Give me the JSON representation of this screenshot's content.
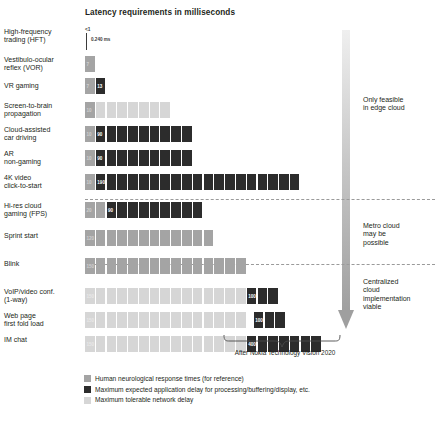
{
  "title": "Latency requirements in milliseconds",
  "caption": "After Nokia Technology Vision 2020",
  "colors": {
    "human": "#a4a4a4",
    "app": "#2c2c2c",
    "net": "#d6d6d6",
    "text": "#231f20"
  },
  "hft_axis": {
    "lt1_label": "<1",
    "value_label": "0.240 ms"
  },
  "zones": [
    {
      "id": "edge",
      "text": "Only feasible\nin edge cloud"
    },
    {
      "id": "metro",
      "text": "Metro cloud\nmay be\npossible"
    },
    {
      "id": "centralized",
      "text": "Centralized\ncloud\nimplementation\nviable"
    }
  ],
  "legend": [
    {
      "key": "human",
      "label": "Human neurological response times (for reference)"
    },
    {
      "key": "app",
      "label": "Maximum expected application delay for processing/buffering/display, etc."
    },
    {
      "key": "net",
      "label": "Maximum tolerable network delay"
    }
  ],
  "chart_data": {
    "type": "bar",
    "orientation": "horizontal",
    "title": "Latency requirements in milliseconds",
    "xlabel": "",
    "ylabel": "",
    "unit": "ms",
    "block_size_ms": 10,
    "grid": false,
    "legend_position": "bottom",
    "series": [
      {
        "name": "Human neurological response times (for reference)",
        "key": "human"
      },
      {
        "name": "Maximum expected application delay for processing/buffering/display, etc.",
        "key": "app"
      },
      {
        "name": "Maximum tolerable network delay",
        "key": "net"
      }
    ],
    "categories": [
      "High-frequency trading (HFT)",
      "Vestibulo-ocular reflex (VOR)",
      "VR gaming",
      "Screen-to-brain propagation",
      "Cloud-assisted car driving",
      "AR non-gaming",
      "4K video click-to-start",
      "Hi-res cloud gaming (FPS)",
      "Sprint start",
      "Blink",
      "VoIP/video conf. (1-way)",
      "Web page first fold load",
      "IM chat"
    ],
    "rows": [
      {
        "label": "High-frequency trading (HFT)",
        "label_lines": [
          "High-frequency",
          "trading (HFT)"
        ],
        "axis_marker": true,
        "human_ms": 0,
        "app_ms": 0,
        "net_ms": 0.24,
        "net_label": "0.240 ms"
      },
      {
        "label": "Vestibulo-ocular reflex (VOR)",
        "label_lines": [
          "Vestibulo-ocular",
          "reflex (VOR)"
        ],
        "human_ms": 7,
        "human_label": "7",
        "app_ms": 0,
        "net_ms": 0
      },
      {
        "label": "VR gaming",
        "label_lines": [
          "VR gaming"
        ],
        "human_ms": 7,
        "human_label": "7",
        "app_ms": 13,
        "app_label": "13",
        "net_ms": 0
      },
      {
        "label": "Screen-to-brain propagation",
        "label_lines": [
          "Screen-to-brain",
          "propagation"
        ],
        "human_ms": 10,
        "human_label": "10",
        "app_ms": 0,
        "net_ms": 70
      },
      {
        "label": "Cloud-assisted car driving",
        "label_lines": [
          "Cloud-assisted",
          "car driving"
        ],
        "human_ms": 10,
        "human_label": "10",
        "app_ms": 90,
        "app_label": "90",
        "net_ms": 0
      },
      {
        "label": "AR non-gaming",
        "label_lines": [
          "AR",
          "non-gaming"
        ],
        "human_ms": 10,
        "human_label": "10",
        "app_ms": 90,
        "app_label": "90",
        "net_ms": 0
      },
      {
        "label": "4K video click-to-start",
        "label_lines": [
          "4K video",
          "click-to-start"
        ],
        "human_ms": 10,
        "human_label": "10",
        "app_ms": 1900,
        "app_label": "1900",
        "app_truncated": true,
        "net_ms": 0
      },
      {
        "label": "Hi-res cloud gaming (FPS)",
        "label_lines": [
          "Hi-res cloud",
          "gaming (FPS)"
        ],
        "human_ms": 20,
        "human_label": "20",
        "app_ms": 90,
        "app_label": "90",
        "net_ms": 0
      },
      {
        "label": "Sprint start",
        "label_lines": [
          "Sprint start"
        ],
        "human_ms": 120,
        "human_label": "120",
        "app_ms": 0,
        "net_ms": 0
      },
      {
        "label": "Blink",
        "label_lines": [
          "Blink"
        ],
        "human_ms": 150,
        "human_label": "150",
        "app_ms": 0,
        "net_ms": 0
      },
      {
        "label": "VoIP/video conf. (1-way)",
        "label_lines": [
          "VoIP/video conf.",
          "(1-way)"
        ],
        "human_ms": 0,
        "net_ms": 150,
        "net_label": "150",
        "app_ms": 100,
        "app_label": "100",
        "app_truncated": true
      },
      {
        "label": "Web page first fold load",
        "label_lines": [
          "Web page",
          "first fold load"
        ],
        "human_ms": 0,
        "net_ms": 150,
        "net_label": "150",
        "net_truncated": true,
        "app_ms": 1000,
        "app_label": "1000",
        "app_truncated": true
      },
      {
        "label": "IM chat",
        "label_lines": [
          "IM chat"
        ],
        "human_ms": 0,
        "net_ms": 150,
        "net_label": "150",
        "app_ms": 4000,
        "app_label": "4000+",
        "app_truncated": true
      }
    ]
  }
}
